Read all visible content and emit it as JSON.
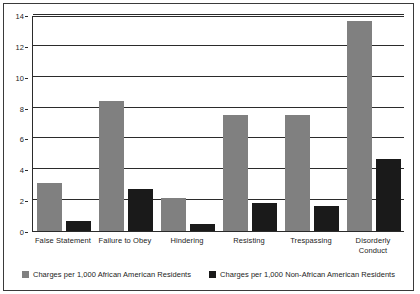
{
  "chart_data": {
    "type": "bar",
    "title": "",
    "subtitle": "",
    "xlabel": "",
    "ylabel": "",
    "ylim": [
      0,
      14
    ],
    "y_ticks": [
      0,
      2,
      4,
      6,
      8,
      10,
      12,
      14
    ],
    "grid": true,
    "legend_position": "bottom",
    "categories": [
      "False Statement",
      "Failure to Obey",
      "Hindering",
      "Resisting",
      "Trespassing",
      "Disorderly Conduct"
    ],
    "series": [
      {
        "name": "Charges per 1,000 African American Residents",
        "color": "#808080",
        "values": [
          3.1,
          8.4,
          2.15,
          7.5,
          7.5,
          13.6
        ]
      },
      {
        "name": "Charges per 1,000 Non-African American Residents",
        "color": "#1a1a1a",
        "values": [
          0.65,
          2.7,
          0.45,
          1.8,
          1.65,
          4.7
        ]
      }
    ]
  },
  "figure": {
    "background_color": "#ffffff",
    "frame_color": "#3a3a3a",
    "axis_color": "#2b2b2b",
    "text_color": "#1c1c1c"
  }
}
